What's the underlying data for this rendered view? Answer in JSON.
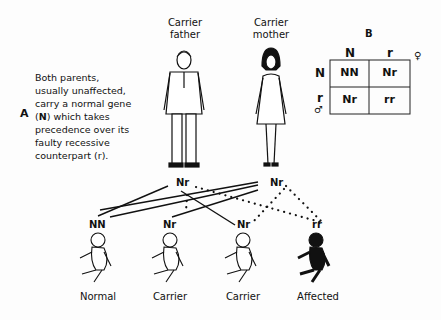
{
  "panel_a": {
    "label": "A",
    "text_parts": [
      "Both parents,",
      "usually unaffected,",
      "carry a normal gene",
      "(",
      "N",
      ") which takes",
      "precedence over its",
      "faulty recessive",
      "counterpart (r)."
    ]
  },
  "parents": {
    "father": {
      "line1": "Carrier",
      "line2": "father",
      "genotype": "Nr"
    },
    "mother": {
      "line1": "Carrier",
      "line2": "mother",
      "genotype": "Nr"
    }
  },
  "children": [
    {
      "genotype": "NN",
      "label": "Normal"
    },
    {
      "genotype": "Nr",
      "label": "Carrier"
    },
    {
      "genotype": "Nr",
      "label": "Carrier"
    },
    {
      "genotype": "rr",
      "label": "Affected"
    }
  ],
  "panel_b": {
    "label": "B",
    "col_headers": [
      "N",
      "r"
    ],
    "row_headers": [
      "N",
      "r"
    ],
    "female_symbol": "♀",
    "male_symbol": "♂",
    "cells": [
      [
        "NN",
        "Nr"
      ],
      [
        "Nr",
        "rr"
      ]
    ]
  }
}
